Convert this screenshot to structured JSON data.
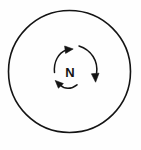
{
  "figure": {
    "background_color": "#fefefe",
    "stroke_color": "#141414",
    "center_label": "N",
    "outer_circle": {
      "name": "outer-circle",
      "cx": 69.5,
      "cy": 71.5,
      "r": 61,
      "stroke_width": 1.6,
      "fill": "none"
    },
    "center_text": {
      "name": "center-label-n",
      "text": "N",
      "x": 70,
      "y": 72,
      "font_size": 13,
      "font_weight": 700
    },
    "arrows": [
      {
        "name": "arrow-upper-left",
        "label": "upper-left curved arrow pointing right",
        "direction": "clockwise",
        "path": "M 54.5 72.5 C 53.5 61.5 58.5 53.0 66.0 50.0",
        "head_tip": {
          "x": 72.6,
          "y": 49.2
        },
        "head_angle_deg": -12,
        "stroke_width": 1.5
      },
      {
        "name": "arrow-right",
        "label": "right curved arrow pointing down",
        "direction": "clockwise",
        "path": "M 79.5 46.5 C 92.0 50.5 98.5 61.0 96.8 73.5",
        "head_tip": {
          "x": 95.8,
          "y": 81.5
        },
        "head_angle_deg": 98,
        "stroke_width": 1.5
      },
      {
        "name": "arrow-lower-left",
        "label": "lower-left curved arrow pointing left",
        "direction": "clockwise",
        "path": "M 76.0 85.5 C 70.0 89.5 64.0 89.0 60.4 85.4",
        "head_tip": {
          "x": 55.5,
          "y": 80.8
        },
        "head_angle_deg": 222,
        "stroke_width": 1.5
      }
    ]
  }
}
